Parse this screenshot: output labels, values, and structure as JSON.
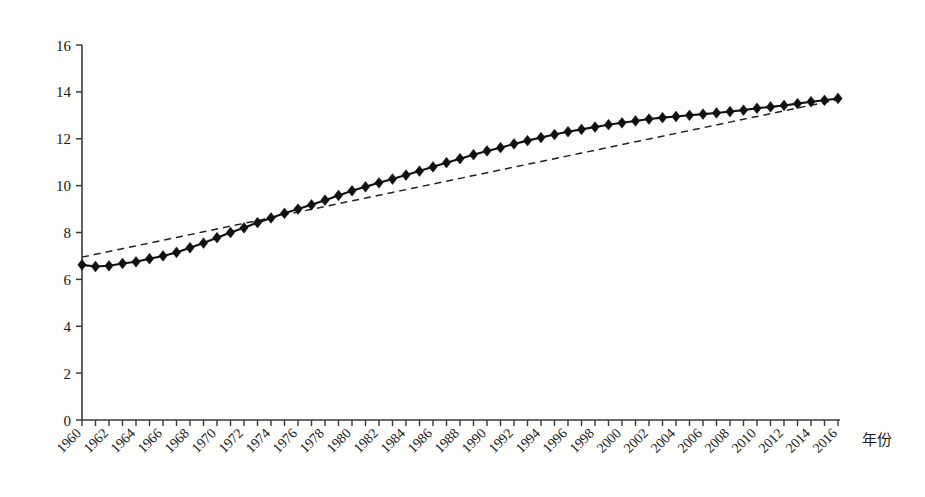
{
  "chart_data": {
    "type": "line",
    "title": "",
    "subtitle": "",
    "xlabel": "年份",
    "ylabel": "",
    "xlim": [
      1960,
      2016
    ],
    "ylim": [
      0,
      16
    ],
    "grid": false,
    "legend": null,
    "y_ticks": [
      0,
      2,
      4,
      6,
      8,
      10,
      12,
      14,
      16
    ],
    "x_ticks": [
      1960,
      1962,
      1964,
      1966,
      1968,
      1970,
      1972,
      1974,
      1976,
      1978,
      1980,
      1982,
      1984,
      1986,
      1988,
      1990,
      1992,
      1994,
      1996,
      1998,
      2000,
      2002,
      2004,
      2006,
      2008,
      2010,
      2012,
      2014,
      2016
    ],
    "x_minor_tick_step": 1,
    "x": [
      1960,
      1961,
      1962,
      1963,
      1964,
      1965,
      1966,
      1967,
      1968,
      1969,
      1970,
      1971,
      1972,
      1973,
      1974,
      1975,
      1976,
      1977,
      1978,
      1979,
      1980,
      1981,
      1982,
      1983,
      1984,
      1985,
      1986,
      1987,
      1988,
      1989,
      1990,
      1991,
      1992,
      1993,
      1994,
      1995,
      1996,
      1997,
      1998,
      1999,
      2000,
      2001,
      2002,
      2003,
      2004,
      2005,
      2006,
      2007,
      2008,
      2009,
      2010,
      2011,
      2012,
      2013,
      2014,
      2015,
      2016
    ],
    "series": [
      {
        "name": "观测值",
        "style": "solid-line-with-diamond-markers",
        "color": "#111111",
        "marker": "diamond",
        "values": [
          6.62,
          6.55,
          6.58,
          6.68,
          6.75,
          6.88,
          7.0,
          7.15,
          7.35,
          7.55,
          7.78,
          8.0,
          8.2,
          8.42,
          8.62,
          8.82,
          9.0,
          9.18,
          9.38,
          9.58,
          9.78,
          9.95,
          10.12,
          10.28,
          10.45,
          10.62,
          10.8,
          10.98,
          11.15,
          11.32,
          11.48,
          11.62,
          11.78,
          11.92,
          12.05,
          12.18,
          12.3,
          12.4,
          12.5,
          12.6,
          12.68,
          12.76,
          12.84,
          12.9,
          12.95,
          13.0,
          13.05,
          13.1,
          13.16,
          13.22,
          13.3,
          13.36,
          13.42,
          13.5,
          13.58,
          13.64,
          13.72
        ]
      },
      {
        "name": "线性趋势线",
        "style": "dashed-line",
        "color": "#222222",
        "marker": "none",
        "values": [
          6.95,
          7.07,
          7.19,
          7.31,
          7.43,
          7.55,
          7.67,
          7.79,
          7.91,
          8.03,
          8.15,
          8.27,
          8.39,
          8.51,
          8.63,
          8.75,
          8.87,
          8.99,
          9.11,
          9.23,
          9.35,
          9.47,
          9.59,
          9.71,
          9.83,
          9.95,
          10.07,
          10.19,
          10.31,
          10.43,
          10.55,
          10.67,
          10.79,
          10.91,
          11.03,
          11.15,
          11.27,
          11.39,
          11.51,
          11.63,
          11.75,
          11.87,
          11.99,
          12.11,
          12.23,
          12.35,
          12.47,
          12.59,
          12.71,
          12.83,
          12.95,
          13.07,
          13.19,
          13.31,
          13.43,
          13.55,
          13.67
        ]
      }
    ]
  },
  "axes": {
    "origin_label": "0",
    "x_axis_title": "年份"
  }
}
